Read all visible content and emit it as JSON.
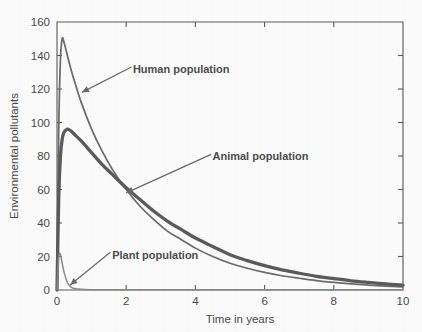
{
  "chart_data": {
    "type": "line",
    "title": "",
    "xlabel": "Time in years",
    "ylabel": "Environmental pollutants",
    "xlim": [
      0,
      10
    ],
    "ylim": [
      0,
      160
    ],
    "xticks": [
      "0",
      "2",
      "4",
      "6",
      "8",
      "10"
    ],
    "xtick_values": [
      0,
      2,
      4,
      6,
      8,
      10
    ],
    "yticks": [
      "0",
      "20",
      "40",
      "60",
      "80",
      "100",
      "120",
      "140",
      "160"
    ],
    "ytick_values": [
      0,
      20,
      40,
      60,
      80,
      100,
      120,
      140,
      160
    ],
    "grid": false,
    "legend_position": "inline-annotations",
    "x": [
      0,
      0.05,
      0.1,
      0.15,
      0.2,
      0.3,
      0.4,
      0.5,
      0.7,
      1.0,
      1.3,
      1.6,
      2.0,
      2.4,
      2.8,
      3.2,
      3.6,
      4.0,
      4.5,
      5.0,
      5.5,
      6.0,
      6.5,
      7.0,
      7.5,
      8.0,
      8.5,
      9.0,
      9.5,
      10.0
    ],
    "series": [
      {
        "name": "Human population",
        "style": "thin",
        "peak_value": 150,
        "peak_time": 0.15,
        "values": [
          0,
          96,
          138,
          150,
          148,
          140,
          132,
          125,
          112,
          96,
          83,
          72,
          60,
          50,
          42,
          35,
          30,
          25,
          20,
          16,
          13,
          10.5,
          8.5,
          7,
          5.6,
          4.5,
          3.6,
          2.9,
          2.3,
          1.8
        ]
      },
      {
        "name": "Animal population",
        "style": "thick",
        "peak_value": 96,
        "peak_time": 0.3,
        "values": [
          0,
          55,
          80,
          90,
          94,
          96,
          95,
          93,
          89,
          82,
          75,
          69,
          61,
          54,
          47,
          41,
          36,
          31,
          26,
          21,
          17.5,
          14.5,
          12,
          10,
          8.2,
          6.8,
          5.5,
          4.5,
          3.6,
          2.9
        ]
      },
      {
        "name": "Plant population",
        "style": "thin-light",
        "peak_value": 21,
        "peak_time": 0.08,
        "values": [
          0,
          20,
          21,
          16,
          11,
          4.5,
          1.8,
          0.9,
          0.4,
          0.2,
          0.15,
          0.12,
          0.1,
          0.1,
          0.1,
          0.1,
          0.1,
          0.1,
          0.1,
          0.1,
          0.1,
          0.1,
          0.1,
          0.1,
          0.1,
          0.1,
          0.1,
          0.1,
          0.1,
          0.1
        ]
      }
    ],
    "annotations": [
      {
        "text": "Human population",
        "target_x": 0.72,
        "target_y": 118,
        "label_x": 2.05,
        "label_y": 132
      },
      {
        "text": "Animal population",
        "target_x": 2.0,
        "target_y": 58,
        "label_x": 4.35,
        "label_y": 80
      },
      {
        "text": "Plant population",
        "target_x": 0.38,
        "target_y": 3,
        "label_x": 1.45,
        "label_y": 21
      }
    ]
  }
}
